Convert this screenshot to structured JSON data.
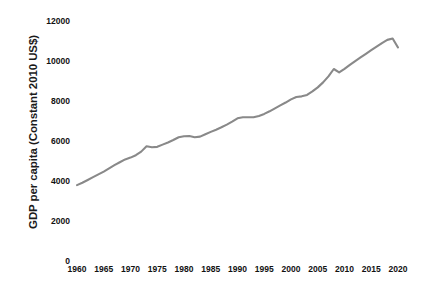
{
  "chart_data": {
    "type": "line",
    "title": "",
    "xlabel": "",
    "ylabel": "GDP per capita (Constant 2010 US$)",
    "grid": false,
    "legend": false,
    "legend_position": "none",
    "line_color": "#898989",
    "text_color": "#111111",
    "background": "#ffffff",
    "xlim": [
      1960,
      2020
    ],
    "ylim": [
      0,
      12000
    ],
    "x_tick_labels": [
      "1960",
      "1965",
      "1970",
      "1975",
      "1980",
      "1985",
      "1990",
      "1995",
      "2000",
      "2005",
      "2010",
      "2015",
      "2020"
    ],
    "x_ticks": [
      1960,
      1965,
      1970,
      1975,
      1980,
      1985,
      1990,
      1995,
      2000,
      2005,
      2010,
      2015,
      2020
    ],
    "y_tick_labels": [
      "0",
      "2000",
      "4000",
      "6000",
      "8000",
      "10000",
      "12000"
    ],
    "y_ticks": [
      0,
      2000,
      4000,
      6000,
      8000,
      10000,
      12000
    ],
    "series": [
      {
        "name": "GDP per capita",
        "x": [
          1960,
          1961,
          1962,
          1963,
          1964,
          1965,
          1966,
          1967,
          1968,
          1969,
          1970,
          1971,
          1972,
          1973,
          1974,
          1975,
          1976,
          1977,
          1978,
          1979,
          1980,
          1981,
          1982,
          1983,
          1984,
          1985,
          1986,
          1987,
          1988,
          1989,
          1990,
          1991,
          1992,
          1993,
          1994,
          1995,
          1996,
          1997,
          1998,
          1999,
          2000,
          2001,
          2002,
          2003,
          2004,
          2005,
          2006,
          2007,
          2008,
          2009,
          2010,
          2011,
          2012,
          2013,
          2014,
          2015,
          2016,
          2017,
          2018,
          2019,
          2020
        ],
        "values": [
          3800,
          3920,
          4060,
          4200,
          4340,
          4480,
          4640,
          4800,
          4950,
          5090,
          5180,
          5300,
          5480,
          5750,
          5700,
          5720,
          5830,
          5940,
          6060,
          6200,
          6250,
          6260,
          6200,
          6230,
          6350,
          6470,
          6580,
          6700,
          6830,
          6980,
          7150,
          7200,
          7200,
          7200,
          7270,
          7370,
          7500,
          7650,
          7800,
          7940,
          8100,
          8220,
          8250,
          8320,
          8500,
          8700,
          8950,
          9250,
          9620,
          9450,
          9630,
          9830,
          10020,
          10200,
          10380,
          10560,
          10740,
          10920,
          11080,
          11150,
          10700
        ]
      }
    ]
  },
  "axis": {
    "y_title": "GDP per capita (Constant 2010 US$)"
  }
}
